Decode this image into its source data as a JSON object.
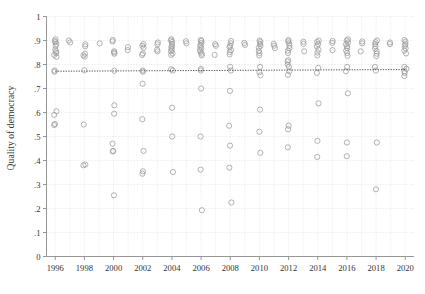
{
  "figure": {
    "background": "#ffffff",
    "marker_color": "#9a9a9a",
    "grid_color": "#d8d8d8",
    "axis_color": "#8a8a8a",
    "trend_color": "#555555",
    "text_color": "#333333"
  },
  "chart_data": {
    "type": "scatter",
    "title": "",
    "subtitle": "",
    "xlabel": "",
    "ylabel": "Quality of democracy",
    "xlim": [
      1995.4,
      2020.6
    ],
    "ylim": [
      0,
      1
    ],
    "grid": true,
    "legend": null,
    "legend_position": "none",
    "xticks": [
      1996,
      1998,
      2000,
      2002,
      2004,
      2006,
      2008,
      2010,
      2012,
      2014,
      2016,
      2018,
      2020
    ],
    "xticklabels": [
      "1996",
      "1998",
      "2000",
      "2002",
      "2004",
      "2006",
      "2008",
      "2010",
      "2012",
      "2014",
      "2016",
      "2018",
      "2020"
    ],
    "yticks": [
      0,
      0.1,
      0.2,
      0.3,
      0.4,
      0.5,
      0.6,
      0.7,
      0.8,
      0.9,
      1
    ],
    "yticklabels": [
      "0",
      ".1",
      ".2",
      ".3",
      ".4",
      ".5",
      ".6",
      ".7",
      ".8",
      ".9",
      "1"
    ],
    "x_minor_gridlines": [
      1997,
      1999,
      2001,
      2003,
      2005,
      2007,
      2009,
      2011,
      2013,
      2015,
      2017,
      2019
    ],
    "marker": "open-circle",
    "marker_size": 3.4,
    "annotations": [],
    "trendline": {
      "type": "linear-fit",
      "style": "dotted",
      "x": [
        1996,
        2020
      ],
      "y": [
        0.772,
        0.779
      ]
    },
    "points": [
      {
        "x": 1996,
        "y": 0.905
      },
      {
        "x": 1996,
        "y": 0.898
      },
      {
        "x": 1996,
        "y": 0.893
      },
      {
        "x": 1996,
        "y": 0.886
      },
      {
        "x": 1996,
        "y": 0.878
      },
      {
        "x": 1996,
        "y": 0.862
      },
      {
        "x": 1996,
        "y": 0.855
      },
      {
        "x": 1996,
        "y": 0.848
      },
      {
        "x": 1996,
        "y": 0.84
      },
      {
        "x": 1996,
        "y": 0.832
      },
      {
        "x": 1996,
        "y": 0.775
      },
      {
        "x": 1996,
        "y": 0.77
      },
      {
        "x": 1996,
        "y": 0.605
      },
      {
        "x": 1996,
        "y": 0.59
      },
      {
        "x": 1996,
        "y": 0.552
      },
      {
        "x": 1996,
        "y": 0.548
      },
      {
        "x": 1997,
        "y": 0.9
      },
      {
        "x": 1997,
        "y": 0.892
      },
      {
        "x": 1998,
        "y": 0.884
      },
      {
        "x": 1998,
        "y": 0.876
      },
      {
        "x": 1998,
        "y": 0.845
      },
      {
        "x": 1998,
        "y": 0.838
      },
      {
        "x": 1998,
        "y": 0.833
      },
      {
        "x": 1998,
        "y": 0.776
      },
      {
        "x": 1998,
        "y": 0.55
      },
      {
        "x": 1998,
        "y": 0.383
      },
      {
        "x": 1998,
        "y": 0.38
      },
      {
        "x": 1999,
        "y": 0.888
      },
      {
        "x": 2000,
        "y": 0.902
      },
      {
        "x": 2000,
        "y": 0.896
      },
      {
        "x": 2000,
        "y": 0.855
      },
      {
        "x": 2000,
        "y": 0.85
      },
      {
        "x": 2000,
        "y": 0.845
      },
      {
        "x": 2000,
        "y": 0.774
      },
      {
        "x": 2000,
        "y": 0.63
      },
      {
        "x": 2000,
        "y": 0.595
      },
      {
        "x": 2000,
        "y": 0.47
      },
      {
        "x": 2000,
        "y": 0.44
      },
      {
        "x": 2000,
        "y": 0.438
      },
      {
        "x": 2000,
        "y": 0.255
      },
      {
        "x": 2001,
        "y": 0.872
      },
      {
        "x": 2001,
        "y": 0.86
      },
      {
        "x": 2002,
        "y": 0.885
      },
      {
        "x": 2002,
        "y": 0.878
      },
      {
        "x": 2002,
        "y": 0.87
      },
      {
        "x": 2002,
        "y": 0.846
      },
      {
        "x": 2002,
        "y": 0.84
      },
      {
        "x": 2002,
        "y": 0.775
      },
      {
        "x": 2002,
        "y": 0.77
      },
      {
        "x": 2002,
        "y": 0.72
      },
      {
        "x": 2002,
        "y": 0.572
      },
      {
        "x": 2002,
        "y": 0.44
      },
      {
        "x": 2002,
        "y": 0.355
      },
      {
        "x": 2002,
        "y": 0.345
      },
      {
        "x": 2003,
        "y": 0.892
      },
      {
        "x": 2003,
        "y": 0.884
      },
      {
        "x": 2003,
        "y": 0.862
      },
      {
        "x": 2003,
        "y": 0.855
      },
      {
        "x": 2004,
        "y": 0.905
      },
      {
        "x": 2004,
        "y": 0.9
      },
      {
        "x": 2004,
        "y": 0.894
      },
      {
        "x": 2004,
        "y": 0.885
      },
      {
        "x": 2004,
        "y": 0.876
      },
      {
        "x": 2004,
        "y": 0.87
      },
      {
        "x": 2004,
        "y": 0.862
      },
      {
        "x": 2004,
        "y": 0.855
      },
      {
        "x": 2004,
        "y": 0.846
      },
      {
        "x": 2004,
        "y": 0.84
      },
      {
        "x": 2004,
        "y": 0.78
      },
      {
        "x": 2004,
        "y": 0.775
      },
      {
        "x": 2004,
        "y": 0.62
      },
      {
        "x": 2004,
        "y": 0.5
      },
      {
        "x": 2004,
        "y": 0.352
      },
      {
        "x": 2005,
        "y": 0.897
      },
      {
        "x": 2005,
        "y": 0.888
      },
      {
        "x": 2006,
        "y": 0.902
      },
      {
        "x": 2006,
        "y": 0.898
      },
      {
        "x": 2006,
        "y": 0.89
      },
      {
        "x": 2006,
        "y": 0.882
      },
      {
        "x": 2006,
        "y": 0.875
      },
      {
        "x": 2006,
        "y": 0.868
      },
      {
        "x": 2006,
        "y": 0.86
      },
      {
        "x": 2006,
        "y": 0.852
      },
      {
        "x": 2006,
        "y": 0.845
      },
      {
        "x": 2006,
        "y": 0.838
      },
      {
        "x": 2006,
        "y": 0.782
      },
      {
        "x": 2006,
        "y": 0.775
      },
      {
        "x": 2006,
        "y": 0.7
      },
      {
        "x": 2006,
        "y": 0.5
      },
      {
        "x": 2006,
        "y": 0.362
      },
      {
        "x": 2006,
        "y": 0.193
      },
      {
        "x": 2007,
        "y": 0.885
      },
      {
        "x": 2007,
        "y": 0.878
      },
      {
        "x": 2007,
        "y": 0.84
      },
      {
        "x": 2008,
        "y": 0.898
      },
      {
        "x": 2008,
        "y": 0.888
      },
      {
        "x": 2008,
        "y": 0.878
      },
      {
        "x": 2008,
        "y": 0.872
      },
      {
        "x": 2008,
        "y": 0.86
      },
      {
        "x": 2008,
        "y": 0.852
      },
      {
        "x": 2008,
        "y": 0.842
      },
      {
        "x": 2008,
        "y": 0.79
      },
      {
        "x": 2008,
        "y": 0.775
      },
      {
        "x": 2008,
        "y": 0.69
      },
      {
        "x": 2008,
        "y": 0.545
      },
      {
        "x": 2008,
        "y": 0.462
      },
      {
        "x": 2008,
        "y": 0.37
      },
      {
        "x": 2008,
        "y": 0.225
      },
      {
        "x": 2009,
        "y": 0.89
      },
      {
        "x": 2009,
        "y": 0.882
      },
      {
        "x": 2010,
        "y": 0.9
      },
      {
        "x": 2010,
        "y": 0.894
      },
      {
        "x": 2010,
        "y": 0.886
      },
      {
        "x": 2010,
        "y": 0.878
      },
      {
        "x": 2010,
        "y": 0.87
      },
      {
        "x": 2010,
        "y": 0.856
      },
      {
        "x": 2010,
        "y": 0.848
      },
      {
        "x": 2010,
        "y": 0.838
      },
      {
        "x": 2010,
        "y": 0.79
      },
      {
        "x": 2010,
        "y": 0.768
      },
      {
        "x": 2010,
        "y": 0.755
      },
      {
        "x": 2010,
        "y": 0.612
      },
      {
        "x": 2010,
        "y": 0.52
      },
      {
        "x": 2010,
        "y": 0.432
      },
      {
        "x": 2011,
        "y": 0.886
      },
      {
        "x": 2011,
        "y": 0.878
      },
      {
        "x": 2011,
        "y": 0.868
      },
      {
        "x": 2012,
        "y": 0.902
      },
      {
        "x": 2012,
        "y": 0.896
      },
      {
        "x": 2012,
        "y": 0.888
      },
      {
        "x": 2012,
        "y": 0.878
      },
      {
        "x": 2012,
        "y": 0.868
      },
      {
        "x": 2012,
        "y": 0.858
      },
      {
        "x": 2012,
        "y": 0.848
      },
      {
        "x": 2012,
        "y": 0.818
      },
      {
        "x": 2012,
        "y": 0.812
      },
      {
        "x": 2012,
        "y": 0.8
      },
      {
        "x": 2012,
        "y": 0.79
      },
      {
        "x": 2012,
        "y": 0.772
      },
      {
        "x": 2012,
        "y": 0.757
      },
      {
        "x": 2012,
        "y": 0.545
      },
      {
        "x": 2012,
        "y": 0.53
      },
      {
        "x": 2012,
        "y": 0.455
      },
      {
        "x": 2013,
        "y": 0.895
      },
      {
        "x": 2013,
        "y": 0.886
      },
      {
        "x": 2013,
        "y": 0.855
      },
      {
        "x": 2014,
        "y": 0.9
      },
      {
        "x": 2014,
        "y": 0.894
      },
      {
        "x": 2014,
        "y": 0.885
      },
      {
        "x": 2014,
        "y": 0.876
      },
      {
        "x": 2014,
        "y": 0.862
      },
      {
        "x": 2014,
        "y": 0.85
      },
      {
        "x": 2014,
        "y": 0.838
      },
      {
        "x": 2014,
        "y": 0.786
      },
      {
        "x": 2014,
        "y": 0.765
      },
      {
        "x": 2014,
        "y": 0.638
      },
      {
        "x": 2014,
        "y": 0.482
      },
      {
        "x": 2014,
        "y": 0.415
      },
      {
        "x": 2015,
        "y": 0.898
      },
      {
        "x": 2015,
        "y": 0.89
      },
      {
        "x": 2015,
        "y": 0.86
      },
      {
        "x": 2016,
        "y": 0.905
      },
      {
        "x": 2016,
        "y": 0.9
      },
      {
        "x": 2016,
        "y": 0.892
      },
      {
        "x": 2016,
        "y": 0.884
      },
      {
        "x": 2016,
        "y": 0.876
      },
      {
        "x": 2016,
        "y": 0.868
      },
      {
        "x": 2016,
        "y": 0.858
      },
      {
        "x": 2016,
        "y": 0.848
      },
      {
        "x": 2016,
        "y": 0.836
      },
      {
        "x": 2016,
        "y": 0.79
      },
      {
        "x": 2016,
        "y": 0.772
      },
      {
        "x": 2016,
        "y": 0.68
      },
      {
        "x": 2016,
        "y": 0.475
      },
      {
        "x": 2016,
        "y": 0.418
      },
      {
        "x": 2017,
        "y": 0.896
      },
      {
        "x": 2017,
        "y": 0.888
      },
      {
        "x": 2017,
        "y": 0.855
      },
      {
        "x": 2018,
        "y": 0.9
      },
      {
        "x": 2018,
        "y": 0.893
      },
      {
        "x": 2018,
        "y": 0.885
      },
      {
        "x": 2018,
        "y": 0.876
      },
      {
        "x": 2018,
        "y": 0.866
      },
      {
        "x": 2018,
        "y": 0.855
      },
      {
        "x": 2018,
        "y": 0.845
      },
      {
        "x": 2018,
        "y": 0.835
      },
      {
        "x": 2018,
        "y": 0.79
      },
      {
        "x": 2018,
        "y": 0.775
      },
      {
        "x": 2018,
        "y": 0.475
      },
      {
        "x": 2018,
        "y": 0.28
      },
      {
        "x": 2019,
        "y": 0.892
      },
      {
        "x": 2019,
        "y": 0.885
      },
      {
        "x": 2020,
        "y": 0.902
      },
      {
        "x": 2020,
        "y": 0.895
      },
      {
        "x": 2020,
        "y": 0.885
      },
      {
        "x": 2020,
        "y": 0.878
      },
      {
        "x": 2020,
        "y": 0.868
      },
      {
        "x": 2020,
        "y": 0.858
      },
      {
        "x": 2020,
        "y": 0.846
      },
      {
        "x": 2020,
        "y": 0.79
      },
      {
        "x": 2020,
        "y": 0.782
      },
      {
        "x": 2020,
        "y": 0.772
      },
      {
        "x": 2020,
        "y": 0.765
      },
      {
        "x": 2020,
        "y": 0.752
      }
    ]
  }
}
